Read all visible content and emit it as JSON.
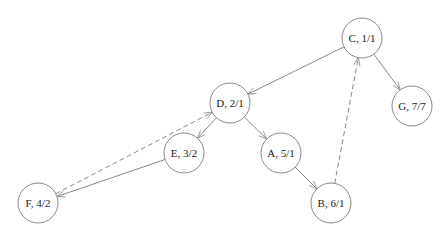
{
  "diagram": {
    "type": "directed-graph",
    "node_radius": 20,
    "colors": {
      "stroke": "#8a8a8a",
      "text": "#222222",
      "fill": "#ffffff"
    },
    "nodes": [
      {
        "id": "C",
        "label": "C, 1/1",
        "x": 362,
        "y": 38
      },
      {
        "id": "G",
        "label": "G, 7/7",
        "x": 412,
        "y": 106
      },
      {
        "id": "D",
        "label": "D, 2/1",
        "x": 230,
        "y": 103
      },
      {
        "id": "E",
        "label": "E, 3/2",
        "x": 184,
        "y": 153
      },
      {
        "id": "A",
        "label": "A, 5/1",
        "x": 281,
        "y": 153
      },
      {
        "id": "F",
        "label": "F, 4/2",
        "x": 38,
        "y": 203
      },
      {
        "id": "B",
        "label": "B, 6/1",
        "x": 331,
        "y": 203
      }
    ],
    "edges": [
      {
        "from": "C",
        "to": "D",
        "style": "solid"
      },
      {
        "from": "C",
        "to": "G",
        "style": "solid"
      },
      {
        "from": "D",
        "to": "E",
        "style": "solid"
      },
      {
        "from": "D",
        "to": "A",
        "style": "solid"
      },
      {
        "from": "A",
        "to": "B",
        "style": "solid"
      },
      {
        "from": "E",
        "to": "F",
        "style": "solid"
      },
      {
        "from": "B",
        "to": "C",
        "style": "dashed"
      },
      {
        "from": "F",
        "to": "D",
        "style": "dashed"
      }
    ]
  }
}
